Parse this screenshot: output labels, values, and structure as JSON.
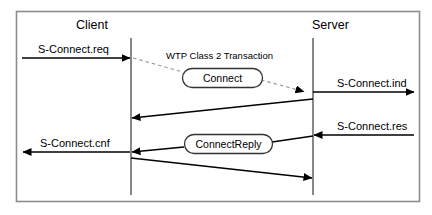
{
  "diagram": {
    "type": "sequence-diagram",
    "title_visible": false,
    "frame": {
      "border_color": "#888888",
      "background": "#ffffff"
    },
    "actors": [
      {
        "id": "client",
        "label": "Client",
        "lifeline_x": 131
      },
      {
        "id": "server",
        "label": "Server",
        "lifeline_x": 313
      }
    ],
    "transaction": {
      "label": "WTP Class 2 Transaction",
      "style": "dashed",
      "color": "#999999"
    },
    "pdus": [
      {
        "id": "connect",
        "label": "Connect"
      },
      {
        "id": "connect-reply",
        "label": "ConnectReply"
      }
    ],
    "messages": [
      {
        "id": "s-connect-req",
        "label": "S-Connect.req",
        "direction": "to-client-lifeline",
        "from": "left-edge",
        "to": "client"
      },
      {
        "id": "s-connect-ind",
        "label": "S-Connect.ind",
        "direction": "to-right-edge",
        "from": "server",
        "to": "right-edge"
      },
      {
        "id": "s-connect-res",
        "label": "S-Connect.res",
        "direction": "to-server",
        "from": "right-edge",
        "to": "server"
      },
      {
        "id": "s-connect-cnf",
        "label": "S-Connect.cnf",
        "direction": "to-left-edge",
        "from": "client",
        "to": "left-edge"
      },
      {
        "id": "ack-server-to-client",
        "label": "",
        "direction": "server-to-client",
        "from": "server",
        "to": "client"
      },
      {
        "id": "ack-client-to-server",
        "label": "",
        "direction": "client-to-server",
        "from": "client",
        "to": "server"
      }
    ],
    "colors": {
      "line": "#000000",
      "dashed": "#9a9a9a",
      "lifeline": "#555555",
      "border": "#8c8c8c"
    }
  }
}
